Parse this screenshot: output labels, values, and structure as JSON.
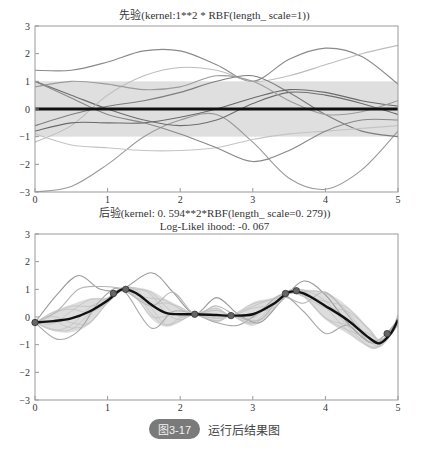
{
  "chart_data": [
    {
      "type": "line",
      "title": "先验(kernel:1**2 * RBF(length_ scale=1))",
      "xlabel": "",
      "ylabel": "",
      "xlim": [
        0,
        5
      ],
      "ylim": [
        -3,
        3
      ],
      "xticks": [
        "0",
        "1",
        "2",
        "3",
        "4",
        "5"
      ],
      "yticks": [
        "3",
        "2",
        "1",
        "0",
        "-1",
        "-2",
        "-3"
      ],
      "grid": false,
      "mean": {
        "name": "prior mean",
        "x": [
          0,
          5
        ],
        "y": [
          0,
          0
        ]
      },
      "band": {
        "name": "±1 std",
        "lower": -1,
        "upper": 1
      },
      "series": [
        {
          "name": "sample 1",
          "x": [
            0,
            0.5,
            1,
            1.5,
            2,
            2.5,
            3,
            3.5,
            4,
            4.5,
            5
          ],
          "y": [
            1.4,
            1.4,
            1.7,
            2.1,
            2.1,
            1.6,
            1.0,
            1.8,
            2.2,
            1.9,
            0.9
          ]
        },
        {
          "name": "sample 2",
          "x": [
            0,
            0.5,
            1,
            1.5,
            2,
            2.5,
            3,
            3.5,
            4,
            4.5,
            5
          ],
          "y": [
            -3.0,
            -2.8,
            -2.0,
            -1.0,
            -0.4,
            -0.2,
            -1.2,
            -2.5,
            -2.9,
            -2.2,
            -0.8
          ]
        },
        {
          "name": "sample 3",
          "x": [
            0,
            0.5,
            1,
            1.5,
            2,
            2.5,
            3,
            3.5,
            4,
            4.5,
            5
          ],
          "y": [
            1.0,
            0.5,
            0.0,
            -0.4,
            -0.6,
            -0.4,
            0.2,
            0.6,
            0.5,
            0.2,
            -0.2
          ]
        },
        {
          "name": "sample 4",
          "x": [
            0,
            0.5,
            1,
            1.5,
            2,
            2.5,
            3,
            3.5,
            4,
            4.5,
            5
          ],
          "y": [
            -1.2,
            -0.6,
            0.5,
            1.2,
            1.5,
            1.4,
            1.0,
            1.2,
            1.6,
            2.0,
            2.3
          ]
        },
        {
          "name": "sample 5",
          "x": [
            0,
            0.5,
            1,
            1.5,
            2,
            2.5,
            3,
            3.5,
            4,
            4.5,
            5
          ],
          "y": [
            -0.6,
            -0.2,
            0.1,
            0.3,
            0.6,
            1.0,
            1.2,
            0.6,
            -0.2,
            -0.8,
            -1.0
          ]
        },
        {
          "name": "sample 6",
          "x": [
            0,
            0.5,
            1,
            1.5,
            2,
            2.5,
            3,
            3.5,
            4,
            4.5,
            5
          ],
          "y": [
            -0.8,
            -0.5,
            -0.5,
            -0.5,
            -0.3,
            0.0,
            0.4,
            0.7,
            0.6,
            0.3,
            0.1
          ]
        },
        {
          "name": "sample 7",
          "x": [
            0,
            0.5,
            1,
            1.5,
            2,
            2.5,
            3,
            3.5,
            4,
            4.5,
            5
          ],
          "y": [
            0.8,
            1.0,
            0.9,
            0.7,
            0.8,
            1.2,
            1.0,
            0.3,
            -0.2,
            -0.1,
            0.3
          ]
        },
        {
          "name": "sample 8",
          "x": [
            0,
            0.5,
            1,
            1.5,
            2,
            2.5,
            3,
            3.5,
            4,
            4.5,
            5
          ],
          "y": [
            -0.9,
            -1.3,
            -1.4,
            -1.5,
            -1.5,
            -1.4,
            -1.1,
            -0.9,
            -0.8,
            -0.7,
            -0.6
          ]
        },
        {
          "name": "sample 9",
          "x": [
            0,
            0.5,
            1,
            1.5,
            2,
            2.5,
            3,
            3.5,
            4,
            4.5,
            5
          ],
          "y": [
            1.0,
            0.4,
            -0.2,
            -0.5,
            -0.9,
            -1.4,
            -1.9,
            -1.5,
            -0.8,
            -0.4,
            -0.4
          ]
        }
      ]
    },
    {
      "type": "line",
      "title": "后验(kernel: 0. 594**2*RBF(length_ scale=0. 279))",
      "subtitle": "Log-Likel ihood: -0. 067",
      "xlabel": "",
      "ylabel": "",
      "xlim": [
        0,
        5
      ],
      "ylim": [
        -3,
        3
      ],
      "xticks": [
        "0",
        "1",
        "2",
        "3",
        "4",
        "5"
      ],
      "yticks": [
        "3",
        "2",
        "1",
        "0",
        "-1",
        "-2",
        "-3"
      ],
      "grid": false,
      "training_points": {
        "x": [
          0.0,
          1.08,
          1.25,
          2.2,
          2.7,
          3.45,
          3.6,
          4.85
        ],
        "y": [
          -0.2,
          0.85,
          1.0,
          0.1,
          0.05,
          0.85,
          0.95,
          -0.6
        ]
      },
      "mean": {
        "name": "posterior mean",
        "x": [
          0,
          0.25,
          0.5,
          0.75,
          1.0,
          1.2,
          1.4,
          1.6,
          1.8,
          2.0,
          2.2,
          2.5,
          2.7,
          3.0,
          3.3,
          3.5,
          3.7,
          4.0,
          4.3,
          4.6,
          4.75,
          4.9,
          5.0
        ],
        "y": [
          -0.2,
          -0.15,
          -0.05,
          0.2,
          0.6,
          1.0,
          0.85,
          0.45,
          0.15,
          0.1,
          0.1,
          0.07,
          0.05,
          0.1,
          0.5,
          0.9,
          0.85,
          0.4,
          -0.1,
          -0.75,
          -0.95,
          -0.6,
          -0.1
        ]
      },
      "band_half_width_max": 0.5,
      "series": [
        {
          "name": "sample 1",
          "x": [
            0,
            0.3,
            0.6,
            0.9,
            1.2,
            1.6,
            1.9,
            2.2,
            2.5,
            2.8,
            3.1,
            3.4,
            3.7,
            4.0,
            4.3,
            4.6,
            4.8,
            5.0
          ],
          "y": [
            -0.2,
            0.8,
            1.5,
            1.0,
            1.0,
            1.6,
            0.9,
            0.1,
            0.7,
            0.1,
            -0.2,
            0.6,
            1.3,
            0.8,
            -0.2,
            -0.9,
            -0.8,
            -0.1
          ]
        },
        {
          "name": "sample 2",
          "x": [
            0,
            0.3,
            0.6,
            0.9,
            1.2,
            1.6,
            1.9,
            2.2,
            2.5,
            2.8,
            3.1,
            3.4,
            3.7,
            4.0,
            4.3,
            4.6,
            4.8,
            5.0
          ],
          "y": [
            -0.2,
            -0.8,
            -0.5,
            0.6,
            1.0,
            -0.4,
            0.2,
            0.1,
            -0.2,
            -0.3,
            0.2,
            0.8,
            0.2,
            -0.6,
            -0.3,
            -0.9,
            -0.7,
            -0.1
          ]
        },
        {
          "name": "sample 3",
          "x": [
            0,
            0.3,
            0.6,
            0.9,
            1.2,
            1.6,
            1.9,
            2.2,
            2.5,
            2.8,
            3.1,
            3.4,
            3.7,
            4.0,
            4.3,
            4.6,
            4.8,
            5.0
          ],
          "y": [
            -0.2,
            0.2,
            1.0,
            1.1,
            1.0,
            0.4,
            0.9,
            0.1,
            0.4,
            0.0,
            -0.1,
            0.7,
            0.5,
            0.9,
            0.1,
            -0.9,
            -0.7,
            -0.1
          ]
        }
      ]
    }
  ],
  "figure": {
    "top_title": "先验(kernel:1**2 * RBF(length_ scale=1))",
    "bottom_title": "后验(kernel: 0. 594**2*RBF(length_ scale=0. 279))",
    "bottom_subtitle": "Log-Likel ihood: -0. 067",
    "xticks": [
      "0",
      "1",
      "2",
      "3",
      "4",
      "5"
    ],
    "yticks": [
      "3",
      "2",
      "1",
      "0",
      "-1",
      "-2",
      "-3"
    ]
  },
  "caption": {
    "badge": "图3-17",
    "text": "运行后结果图",
    "badge_color": "#7a7a7a"
  },
  "colors": {
    "axis": "#999999",
    "mean": "#111111",
    "band": "#d9d9d9",
    "sample": "#8c8c8c"
  }
}
